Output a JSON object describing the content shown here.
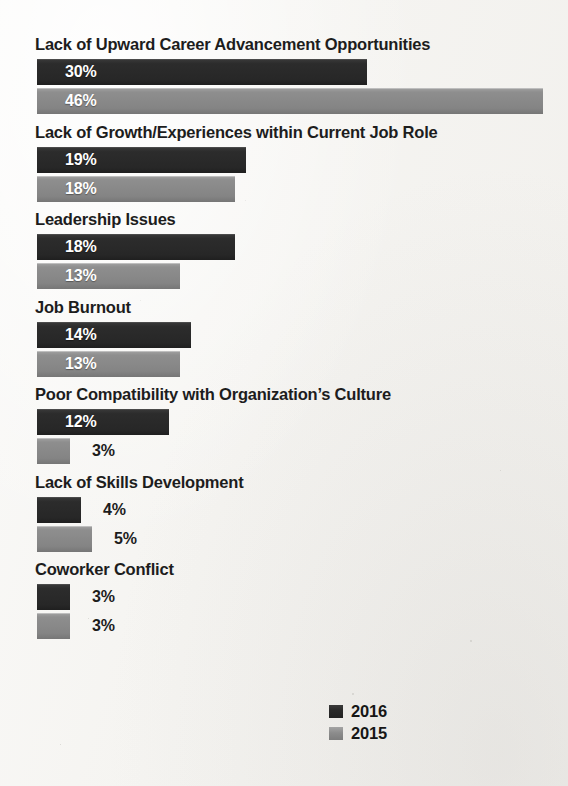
{
  "chart_data": {
    "type": "bar",
    "orientation": "horizontal",
    "title": "",
    "xlabel": "",
    "ylabel": "",
    "grid": false,
    "legend_position": "bottom-right",
    "value_suffix": "%",
    "categories": [
      "Lack of Upward Career Advancement Opportunities",
      "Lack of Growth/Experiences within Current Job Role",
      "Leadership Issues",
      "Job Burnout",
      "Poor Compatibility with Organization’s Culture",
      "Lack of Skills Development",
      "Coworker Conflict"
    ],
    "series": [
      {
        "name": "2016",
        "color": "#2b2b2b",
        "values": [
          30,
          19,
          18,
          14,
          12,
          4,
          3
        ]
      },
      {
        "name": "2015",
        "color": "#8a8a8a",
        "values": [
          46,
          18,
          13,
          13,
          3,
          5,
          3
        ]
      }
    ],
    "value_labels": {
      "2016": [
        "30%",
        "19%",
        "18%",
        "14%",
        "12%",
        "4%",
        "3%"
      ],
      "2015": [
        "46%",
        "18%",
        "13%",
        "13%",
        "3%",
        "5%",
        "3%"
      ]
    },
    "xlim": [
      0,
      46
    ]
  },
  "legend": {
    "items": [
      {
        "label": "2016",
        "series": "2016"
      },
      {
        "label": "2015",
        "series": "2015"
      }
    ]
  },
  "colors": {
    "background": "#f5f4f1",
    "series_2016": "#2b2b2b",
    "series_2015": "#8a8a8a",
    "text": "#1d1d1d",
    "inside_label": "#ffffff"
  }
}
